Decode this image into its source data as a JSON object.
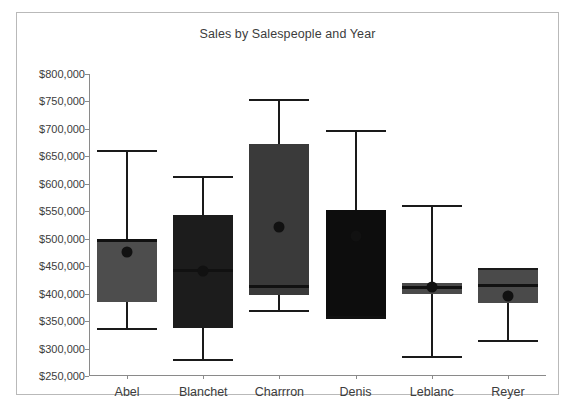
{
  "chart_data": {
    "type": "box",
    "title": "Sales by Salespeople and Year",
    "xlabel": "",
    "ylabel": "",
    "ylim": [
      250000,
      800000
    ],
    "ytick_step": 50000,
    "ytick_labels": [
      "$800,000",
      "$750,000",
      "$700,000",
      "$650,000",
      "$600,000",
      "$550,000",
      "$500,000",
      "$450,000",
      "$400,000",
      "$350,000",
      "$300,000",
      "$250,000"
    ],
    "ytick_values": [
      800000,
      750000,
      700000,
      650000,
      600000,
      550000,
      500000,
      450000,
      400000,
      350000,
      300000,
      250000
    ],
    "grid": false,
    "legend": "none",
    "categories": [
      "Abel",
      "Blanchet",
      "Charrron",
      "Denis",
      "Leblanc",
      "Reyer"
    ],
    "boxes": [
      {
        "name": "Abel",
        "whisker_low": 335000,
        "q1": 385000,
        "median": 497000,
        "q3": 497000,
        "whisker_high": 660000,
        "mean": 476000,
        "fill": "#4d4d4d"
      },
      {
        "name": "Blanchet",
        "whisker_low": 280000,
        "q1": 337000,
        "median": 443000,
        "q3": 543000,
        "whisker_high": 613000,
        "mean": 441000,
        "fill": "#1c1c1c"
      },
      {
        "name": "Charrron",
        "whisker_low": 368000,
        "q1": 397000,
        "median": 413000,
        "q3": 672000,
        "whisker_high": 753000,
        "mean": 521000,
        "fill": "#3a3a3a"
      },
      {
        "name": "Denis",
        "whisker_low": 355000,
        "q1": 355000,
        "median": 357000,
        "q3": 553000,
        "whisker_high": 697000,
        "mean": 505000,
        "fill": "#0d0d0d"
      },
      {
        "name": "Leblanc",
        "whisker_low": 285000,
        "q1": 400000,
        "median": 412000,
        "q3": 420000,
        "whisker_high": 560000,
        "mean": 412000,
        "fill": "#4a4a4a"
      },
      {
        "name": "Reyer",
        "whisker_low": 313000,
        "q1": 383000,
        "median": 415000,
        "q3": 443000,
        "whisker_high": 445000,
        "mean": 396000,
        "fill": "#4a4a4a"
      }
    ]
  },
  "colors": {
    "frame_border": "#b9b9b9",
    "axis": "#8a8a8a",
    "text": "#3c3c3c",
    "line": "#1a1a1a",
    "background": "#ffffff"
  }
}
